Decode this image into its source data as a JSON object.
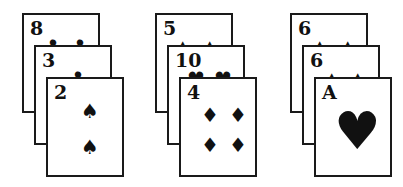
{
  "groups": [
    {
      "cards": [
        {
          "rank": "8",
          "suit": "clubs",
          "glyph": "♣",
          "pips": [
            [
              20,
              22
            ],
            [
              47,
              22
            ]
          ]
        },
        {
          "rank": "3",
          "suit": "clubs",
          "glyph": "♣",
          "pips": [
            [
              33,
              22
            ]
          ]
        },
        {
          "rank": "2",
          "suit": "spades",
          "glyph": "♠",
          "pips": [
            [
              33,
              22
            ],
            [
              33,
              58
            ]
          ]
        }
      ]
    },
    {
      "cards": [
        {
          "rank": "5",
          "suit": "spades",
          "glyph": "▲",
          "pips": [
            [
              18,
              22
            ],
            [
              45,
              22
            ]
          ]
        },
        {
          "rank": "10",
          "suit": "hearts",
          "glyph": "♥",
          "pips": [
            [
              18,
              22
            ],
            [
              45,
              22
            ]
          ]
        },
        {
          "rank": "4",
          "suit": "diamonds",
          "glyph": "♦",
          "pips": [
            [
              20,
              26
            ],
            [
              48,
              26
            ],
            [
              20,
              56
            ],
            [
              48,
              56
            ]
          ]
        }
      ]
    },
    {
      "cards": [
        {
          "rank": "6",
          "suit": "spades",
          "glyph": "▲",
          "pips": [
            [
              20,
              22
            ],
            [
              48,
              22
            ]
          ]
        },
        {
          "rank": "6",
          "suit": "spades",
          "glyph": "▲",
          "pips": [
            [
              20,
              22
            ],
            [
              46,
              22
            ]
          ]
        },
        {
          "rank": "A",
          "suit": "hearts",
          "glyph": "♥",
          "pips": [
            [
              18,
              26
            ]
          ],
          "big": true
        }
      ]
    }
  ],
  "layout": {
    "group_x": [
      22,
      155,
      290
    ],
    "card_offsets": [
      [
        0,
        13
      ],
      [
        12,
        45
      ],
      [
        24,
        77
      ]
    ]
  }
}
